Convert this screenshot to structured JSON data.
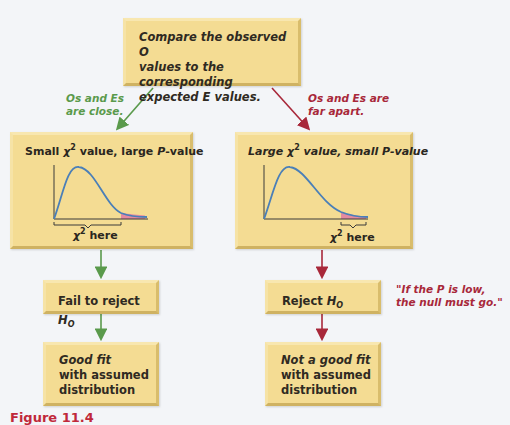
{
  "top_box": {
    "lines": [
      "Compare the observed O",
      "values to the corresponding",
      "expected E values."
    ]
  },
  "branches": {
    "left": {
      "condition_lines": [
        "Os and Es",
        "are close."
      ],
      "color": "#5a9a4c",
      "panel_title": {
        "prefix": "Small ",
        "chi": "χ",
        "sup": "2",
        "middle": " value, large ",
        "p": "P",
        "suffix": "-value"
      },
      "axis_label": {
        "chi": "χ",
        "sup": "2",
        "text": " here"
      },
      "decision": {
        "text": "Fail to reject ",
        "h": "H",
        "sub": "O"
      },
      "conclusion_lines": [
        "Good fit",
        "with assumed",
        "distribution"
      ]
    },
    "right": {
      "condition_lines": [
        "Os and Es are",
        "far apart."
      ],
      "color": "#a8283a",
      "panel_title": {
        "prefix": "Large ",
        "chi": "χ",
        "sup": "2",
        "middle": " value, small ",
        "p": "P",
        "suffix": "-value"
      },
      "axis_label": {
        "chi": "χ",
        "sup": "2",
        "text": " here"
      },
      "decision": {
        "text": "Reject ",
        "h": "H",
        "sub": "O"
      },
      "conclusion_lines": [
        "Not a good fit",
        "with assumed",
        "distribution"
      ]
    }
  },
  "quote": {
    "lines": [
      "\"If the P is low,",
      "the null must go.\""
    ]
  },
  "caption": {
    "text": "Figure 11.4"
  },
  "colors": {
    "box_fill": "#f4dc93",
    "curve": "#4a7fb8",
    "tail": "#e48aa0",
    "green": "#5a9a4c",
    "red": "#a8283a"
  }
}
